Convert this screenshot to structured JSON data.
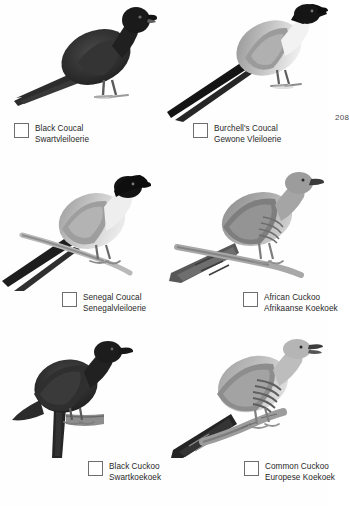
{
  "page": {
    "number": "208",
    "background": "#ffffff",
    "ink": "#282828"
  },
  "entries": [
    {
      "name_en": "Black Coucal",
      "name_af": "Swartvleiloerie",
      "checkbox_checked": false,
      "plate": {
        "subject": "black-coucal",
        "description": "All-dark coucal standing, facing right, long dark tail sweeping to lower left",
        "body_color": "#262626",
        "wing_color": "#3b3b3b",
        "tail_color": "#2e2e2e",
        "leg_color": "#8d8d8d"
      }
    },
    {
      "name_en": "Burchell's Coucal",
      "name_af": "Gewone Vleiloerie",
      "checkbox_checked": false,
      "plate": {
        "subject": "burchells-coucal",
        "description": "Coucal perched facing right with black cap, pale white underparts, grey mottled back and long black tail",
        "body_color": "#e8e8e8",
        "wing_color": "#8a8a8a",
        "tail_color": "#1c1c1c",
        "leg_color": "#6f6f6f"
      }
    },
    {
      "name_en": "Senegal Coucal",
      "name_af": "Senegalvleiloerie",
      "checkbox_checked": false,
      "plate": {
        "subject": "senegal-coucal",
        "description": "Coucal perched on a branch, black cap, white breast, grey-brown back, long dark tail to lower left",
        "body_color": "#d8d8d8",
        "wing_color": "#9a9a9a",
        "tail_color": "#1f1f1f",
        "leg_color": "#7a7a7a"
      }
    },
    {
      "name_en": "African Cuckoo",
      "name_af": "Afrikaanse Koekoek",
      "checkbox_checked": false,
      "plate": {
        "subject": "african-cuckoo",
        "description": "Grey cuckoo perched on a branch facing right, finely barred belly, long pointed tail to lower left",
        "body_color": "#a3a3a3",
        "wing_color": "#787878",
        "tail_color": "#555555",
        "leg_color": "#8c8c8c"
      }
    },
    {
      "name_en": "Black Cuckoo",
      "name_af": "Swartkoekoek",
      "checkbox_checked": false,
      "plate": {
        "subject": "black-cuckoo",
        "description": "Sooty black cuckoo perched upright on a stump facing right, long tail hanging down",
        "body_color": "#232323",
        "wing_color": "#333333",
        "tail_color": "#2a2a2a",
        "leg_color": "#777777"
      }
    },
    {
      "name_en": "Common Cuckoo",
      "name_af": "Europese Koekoek",
      "checkbox_checked": false,
      "plate": {
        "subject": "common-cuckoo",
        "description": "Pale grey cuckoo on a branch with open bill, heavily barred underparts, dark tail to lower left",
        "body_color": "#c4c4c4",
        "wing_color": "#8f8f8f",
        "tail_color": "#2b2b2b",
        "leg_color": "#909090"
      }
    }
  ]
}
